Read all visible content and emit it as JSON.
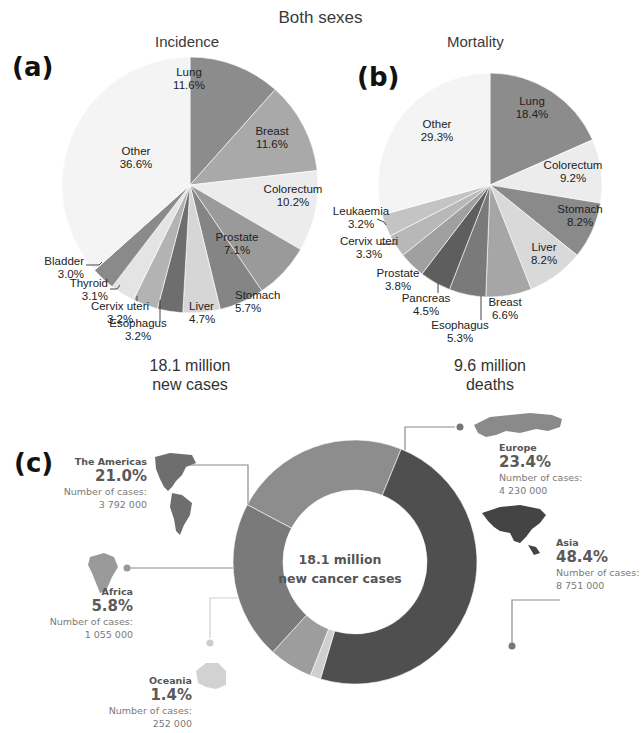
{
  "header": {
    "title": "Both sexes"
  },
  "panels": {
    "a": {
      "label": "(a)",
      "title": "Incidence",
      "total_line1": "18.1 million",
      "total_line2": "new cases"
    },
    "b": {
      "label": "(b)",
      "title": "Mortality",
      "total_line1": "9.6 million",
      "total_line2": "deaths"
    },
    "c": {
      "label": "(c)",
      "center_line1": "18.1 million",
      "center_line2": "new cancer cases",
      "cases_label": "Number of cases:"
    }
  },
  "chart_data": [
    {
      "type": "pie",
      "title": "Incidence",
      "subtitle": "Both sexes",
      "total": "18.1 million new cases",
      "categories": [
        "Lung",
        "Breast",
        "Colorectum",
        "Prostate",
        "Stomach",
        "Liver",
        "Esophagus",
        "Cervix uteri",
        "Thyroid",
        "Bladder",
        "Other"
      ],
      "values": [
        11.6,
        11.6,
        10.2,
        7.1,
        5.7,
        4.7,
        3.2,
        3.2,
        3.1,
        3.0,
        36.6
      ],
      "colors": [
        "#8c8c8c",
        "#a9a9a9",
        "#ececec",
        "#9a9a9a",
        "#858585",
        "#d6d6d6",
        "#6e6e6e",
        "#b3b3b3",
        "#e4e4e4",
        "#8a8a8a",
        "#f4f4f4"
      ],
      "unit": "%",
      "start_angle_deg": 0,
      "direction": "clockwise"
    },
    {
      "type": "pie",
      "title": "Mortality",
      "subtitle": "Both sexes",
      "total": "9.6 million deaths",
      "categories": [
        "Lung",
        "Colorectum",
        "Stomach",
        "Liver",
        "Breast",
        "Esophagus",
        "Pancreas",
        "Prostate",
        "Cervix uteri",
        "Leukaemia",
        "Other"
      ],
      "values": [
        18.4,
        9.2,
        8.2,
        8.2,
        6.6,
        5.3,
        4.5,
        3.8,
        3.3,
        3.2,
        29.3
      ],
      "colors": [
        "#8c8c8c",
        "#ececec",
        "#8a8a8a",
        "#d9d9d9",
        "#a6a6a6",
        "#7a7a7a",
        "#5e5e5e",
        "#a0a0a0",
        "#b8b8b8",
        "#c4c4c4",
        "#f4f4f4"
      ],
      "unit": "%",
      "start_angle_deg": 0,
      "direction": "clockwise"
    },
    {
      "type": "pie",
      "subtype": "donut",
      "title": "18.1 million new cancer cases",
      "categories": [
        "Europe",
        "Asia",
        "Oceania",
        "Africa",
        "The Americas"
      ],
      "values": [
        23.4,
        48.4,
        1.4,
        5.8,
        21.0
      ],
      "cases": [
        "4 230 000",
        "8 751 000",
        "252 000",
        "1 055 000",
        "3 792 000"
      ],
      "colors": [
        "#8d8d8d",
        "#4f4f4f",
        "#cfcfcf",
        "#9d9d9d",
        "#7a7a7a"
      ],
      "unit": "%"
    }
  ],
  "pie_labels": {
    "a": [
      {
        "name": "Lung",
        "value": "11.6%",
        "x": 189,
        "y": 76,
        "anchor": "middle"
      },
      {
        "name": "Breast",
        "value": "11.6%",
        "x": 272,
        "y": 135,
        "anchor": "middle"
      },
      {
        "name": "Colorectum",
        "value": "10.2%",
        "x": 293,
        "y": 193,
        "anchor": "middle"
      },
      {
        "name": "Prostate",
        "value": "7.1%",
        "x": 237,
        "y": 241,
        "anchor": "middle"
      },
      {
        "name": "Stomach",
        "value": "5.7%",
        "x": 235,
        "y": 299,
        "anchor": "start"
      },
      {
        "name": "Liver",
        "value": "4.7%",
        "x": 189,
        "y": 310,
        "anchor": "start"
      },
      {
        "name": "Esophagus",
        "value": "3.2%",
        "x": 138,
        "y": 327,
        "anchor": "middle"
      },
      {
        "name": "Cervix uteri",
        "value": "3.2%",
        "x": 120,
        "y": 310,
        "anchor": "middle"
      },
      {
        "name": "Thyroid",
        "value": "3.1%",
        "x": 108,
        "y": 287,
        "anchor": "end"
      },
      {
        "name": "Bladder",
        "value": "3.0%",
        "x": 84,
        "y": 265,
        "anchor": "end"
      },
      {
        "name": "Other",
        "value": "36.6%",
        "x": 136,
        "y": 155,
        "anchor": "middle"
      }
    ],
    "b": [
      {
        "name": "Lung",
        "value": "18.4%",
        "x": 532,
        "y": 105,
        "anchor": "middle"
      },
      {
        "name": "Colorectum",
        "value": "9.2%",
        "x": 573,
        "y": 169,
        "anchor": "middle"
      },
      {
        "name": "Stomach",
        "value": "8.2%",
        "x": 580,
        "y": 213,
        "anchor": "middle"
      },
      {
        "name": "Liver",
        "value": "8.2%",
        "x": 544,
        "y": 251,
        "anchor": "middle"
      },
      {
        "name": "Breast",
        "value": "6.6%",
        "x": 505,
        "y": 306,
        "anchor": "middle"
      },
      {
        "name": "Esophagus",
        "value": "5.3%",
        "x": 460,
        "y": 329,
        "anchor": "middle"
      },
      {
        "name": "Pancreas",
        "value": "4.5%",
        "x": 426,
        "y": 302,
        "anchor": "middle"
      },
      {
        "name": "Prostate",
        "value": "3.8%",
        "x": 398,
        "y": 277,
        "anchor": "middle"
      },
      {
        "name": "Cervix uteri",
        "value": "3.3%",
        "x": 369,
        "y": 245,
        "anchor": "middle"
      },
      {
        "name": "Leukaemia",
        "value": "3.2%",
        "x": 361,
        "y": 215,
        "anchor": "middle"
      },
      {
        "name": "Other",
        "value": "29.3%",
        "x": 437,
        "y": 128,
        "anchor": "middle"
      }
    ]
  },
  "regions": [
    {
      "key": "americas",
      "name": "The Americas",
      "pct": "21.0%",
      "cases": "3 792 000"
    },
    {
      "key": "europe",
      "name": "Europe",
      "pct": "23.4%",
      "cases": "4 230 000"
    },
    {
      "key": "asia",
      "name": "Asia",
      "pct": "48.4%",
      "cases": "8 751 000"
    },
    {
      "key": "africa",
      "name": "Africa",
      "pct": "5.8%",
      "cases": "1 055 000"
    },
    {
      "key": "oceania",
      "name": "Oceania",
      "pct": "1.4%",
      "cases": "252 000"
    }
  ]
}
